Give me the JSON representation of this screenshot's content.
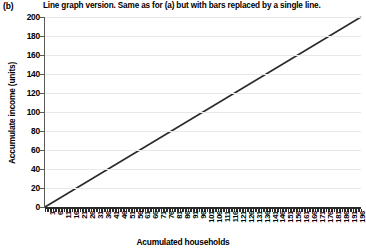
{
  "caption": {
    "panel_label": "(b)",
    "text": "Line graph version. Same as for (a) but with bars replaced by a single line."
  },
  "chart_data": {
    "type": "line",
    "title": "",
    "xlabel": "Acumulated households",
    "ylabel": "Accumulate income (units)",
    "xlim": [
      1,
      200
    ],
    "ylim": [
      0,
      200
    ],
    "grid": true,
    "legend": false,
    "line_color": "#2a2a2a",
    "axis_color": "#5a5a5a",
    "grid_color": "#e8e8e8",
    "ytick_labels": [
      "0",
      "20",
      "40",
      "60",
      "80",
      "100",
      "120",
      "140",
      "160",
      "180",
      "200"
    ],
    "ytick_values": [
      0,
      20,
      40,
      60,
      80,
      100,
      120,
      140,
      160,
      180,
      200
    ],
    "xtick_labels": [
      "1",
      "6",
      "11",
      "16",
      "21",
      "26",
      "31",
      "36",
      "41",
      "46",
      "51",
      "56",
      "61",
      "66",
      "71",
      "76",
      "81",
      "86",
      "91",
      "96",
      "101",
      "106",
      "111",
      "116",
      "121",
      "126",
      "131",
      "136",
      "141",
      "146",
      "151",
      "156",
      "161",
      "166",
      "171",
      "176",
      "181",
      "186",
      "191",
      "196"
    ],
    "xtick_values": [
      1,
      6,
      11,
      16,
      21,
      26,
      31,
      36,
      41,
      46,
      51,
      56,
      61,
      66,
      71,
      76,
      81,
      86,
      91,
      96,
      101,
      106,
      111,
      116,
      121,
      126,
      131,
      136,
      141,
      146,
      151,
      156,
      161,
      166,
      171,
      176,
      181,
      186,
      191,
      196
    ],
    "series": [
      {
        "name": "Cumulative income",
        "x": [
          1,
          200
        ],
        "values": [
          0,
          200
        ]
      }
    ]
  }
}
